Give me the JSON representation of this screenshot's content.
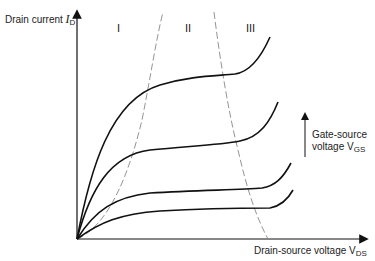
{
  "diagram": {
    "y_axis": {
      "label_text": "Drain current ",
      "symbol": "I",
      "subscript": "D"
    },
    "x_axis": {
      "label_text": "Drain-source voltage V",
      "subscript": "DS"
    },
    "gate_arrow": {
      "line1": "Gate-source",
      "line2": "voltage V",
      "subscript": "GS"
    },
    "regions": [
      {
        "label": "I"
      },
      {
        "label": "II"
      },
      {
        "label": "III"
      }
    ],
    "curves": [
      {
        "name": "VGS-4 (highest)",
        "note": "saturates ~I_D high, breakdown rise at right"
      },
      {
        "name": "VGS-3"
      },
      {
        "name": "VGS-2"
      },
      {
        "name": "VGS-1 (lowest)"
      }
    ],
    "colors": {
      "curve": "#111111",
      "axis": "#111111",
      "boundary_dashed": "#888888"
    }
  }
}
